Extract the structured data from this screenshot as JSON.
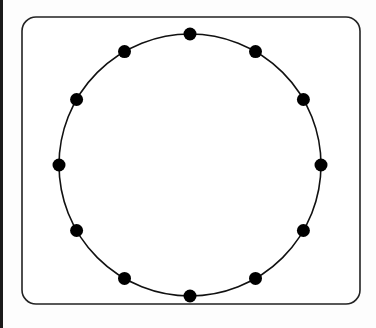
{
  "diagram": {
    "type": "circle-with-points",
    "frame": {
      "x": 22,
      "y": 17,
      "width": 338,
      "height": 287,
      "corner_radius": 14,
      "stroke": "#222222"
    },
    "circle": {
      "cx": 190,
      "cy": 165,
      "r": 131,
      "stroke": "#111111"
    },
    "points": {
      "count": 12,
      "radius": 6.5,
      "color": "#000000",
      "angles_deg": [
        90,
        60,
        30,
        0,
        -30,
        -60,
        -90,
        -120,
        -150,
        180,
        150,
        120
      ]
    }
  }
}
